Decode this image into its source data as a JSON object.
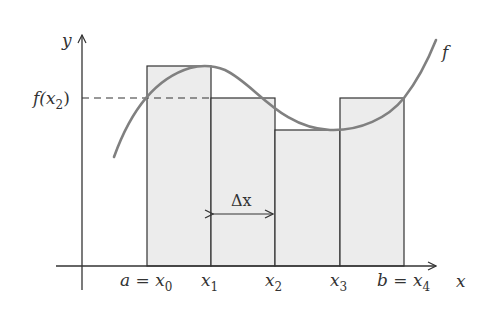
{
  "diagram": {
    "type": "riemann-sum-midpoint-style",
    "axes": {
      "x_label": "x",
      "y_label": "y"
    },
    "function_label": "f",
    "y_marker_label": {
      "prefix": "f(x",
      "sub": "2",
      "suffix": ")"
    },
    "delta_label": "Δx",
    "x_ticks": [
      {
        "prefix": "a = x",
        "sub": "0"
      },
      {
        "prefix": "x",
        "sub": "1"
      },
      {
        "prefix": "x",
        "sub": "2"
      },
      {
        "prefix": "x",
        "sub": "3"
      },
      {
        "prefix": "b = x",
        "sub": "4"
      }
    ],
    "rectangles": [
      {
        "interval": "[x0, x1]",
        "height_ref": "f(x1)"
      },
      {
        "interval": "[x1, x2]",
        "height_ref": "f(x2)"
      },
      {
        "interval": "[x2, x3]",
        "height_ref": "f(x3)"
      },
      {
        "interval": "[x3, x4]",
        "height_ref": "f(x4)"
      }
    ],
    "colors": {
      "rect_fill": "#ececec",
      "rect_stroke": "#333333",
      "curve": "#808080",
      "axis": "#333333"
    }
  }
}
